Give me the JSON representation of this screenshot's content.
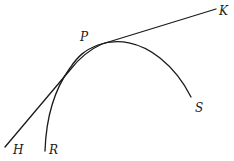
{
  "diagram": {
    "colors": {
      "stroke": "#1a1a1a",
      "background": "#ffffff"
    },
    "labels": {
      "P": "P",
      "K": "K",
      "H": "H",
      "R": "R",
      "S": "S"
    },
    "elements": {
      "tangent_line": {
        "from": "H",
        "to": "K"
      },
      "curve_RS": {
        "from": "R",
        "through": "P",
        "to": "S"
      }
    }
  }
}
